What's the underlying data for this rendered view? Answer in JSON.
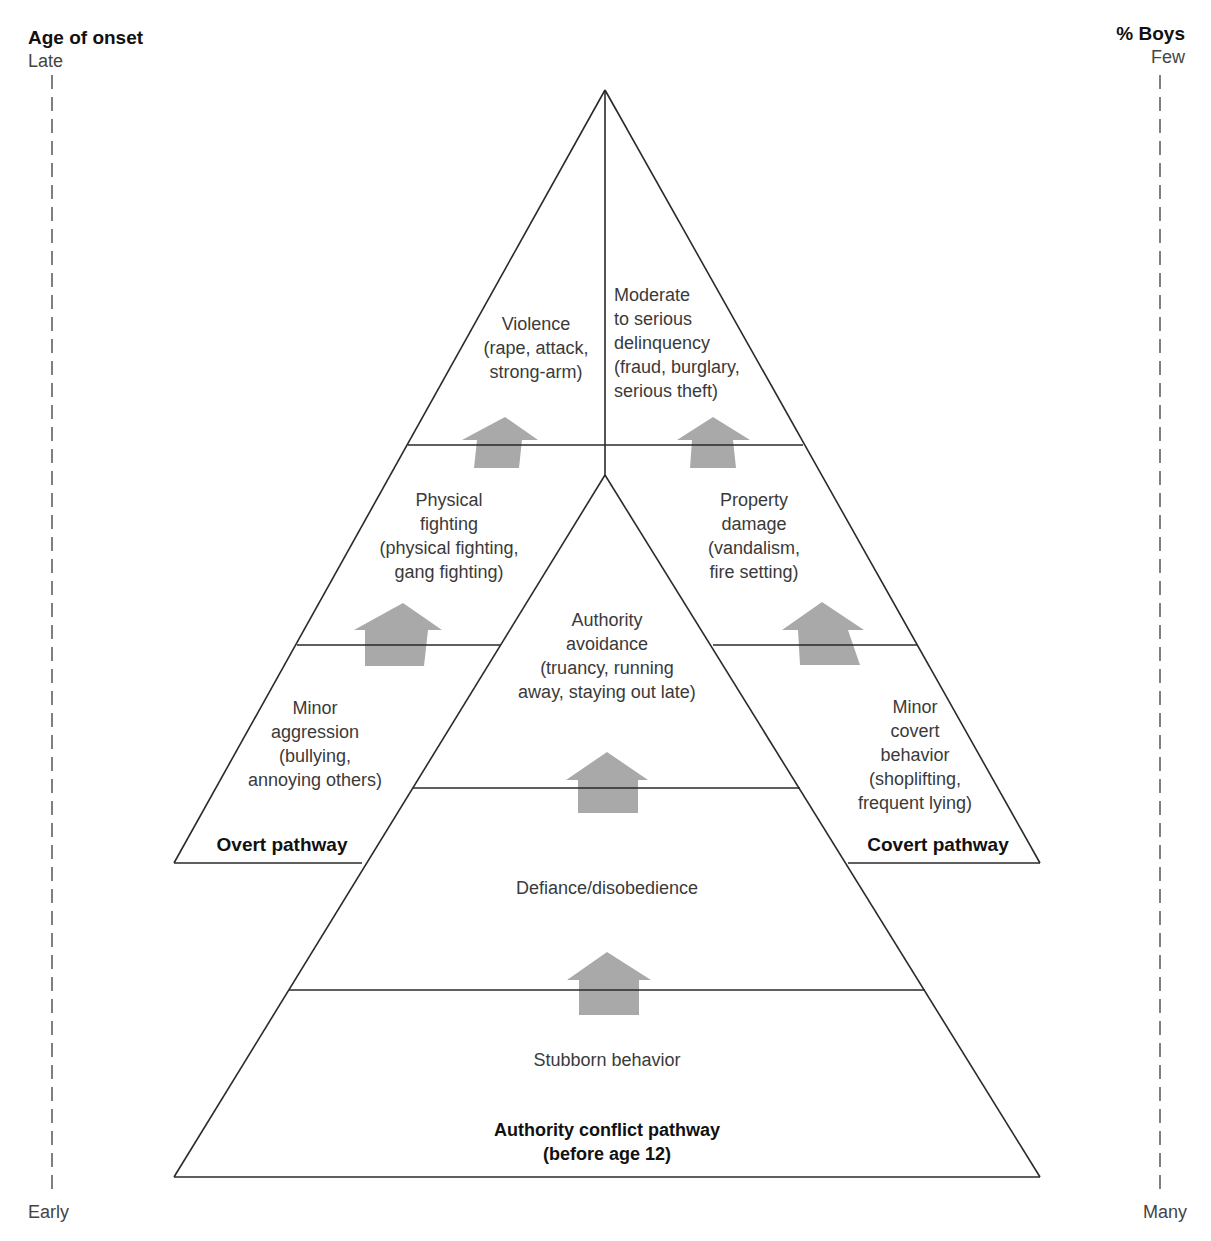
{
  "left_axis": {
    "title": "Age of onset",
    "top_label": "Late",
    "bottom_label": "Early"
  },
  "right_axis": {
    "title": "% Boys",
    "top_label": "Few",
    "bottom_label": "Many"
  },
  "overt": {
    "pathway_label": "Overt pathway",
    "levels": [
      "Violence\n(rape, attack,\nstrong-arm)",
      "Physical\nfighting\n(physical fighting,\ngang fighting)",
      "Minor\naggression\n(bullying,\nannoying others)"
    ]
  },
  "covert": {
    "pathway_label": "Covert pathway",
    "levels": [
      "Moderate\nto serious\ndelinquency\n(fraud, burglary,\nserious theft)",
      "Property\ndamage\n(vandalism,\nfire setting)",
      "Minor\ncovert\nbehavior\n(shoplifting,\nfrequent lying)"
    ]
  },
  "authority": {
    "pathway_label": "Authority conflict pathway\n(before age 12)",
    "levels": [
      "Authority\navoidance\n(truancy, running\naway, staying out late)",
      "Defiance/disobedience",
      "Stubborn behavior"
    ]
  },
  "colors": {
    "line": "#2a2a2a",
    "arrow": "#a9a9a9",
    "dash": "#555555"
  }
}
